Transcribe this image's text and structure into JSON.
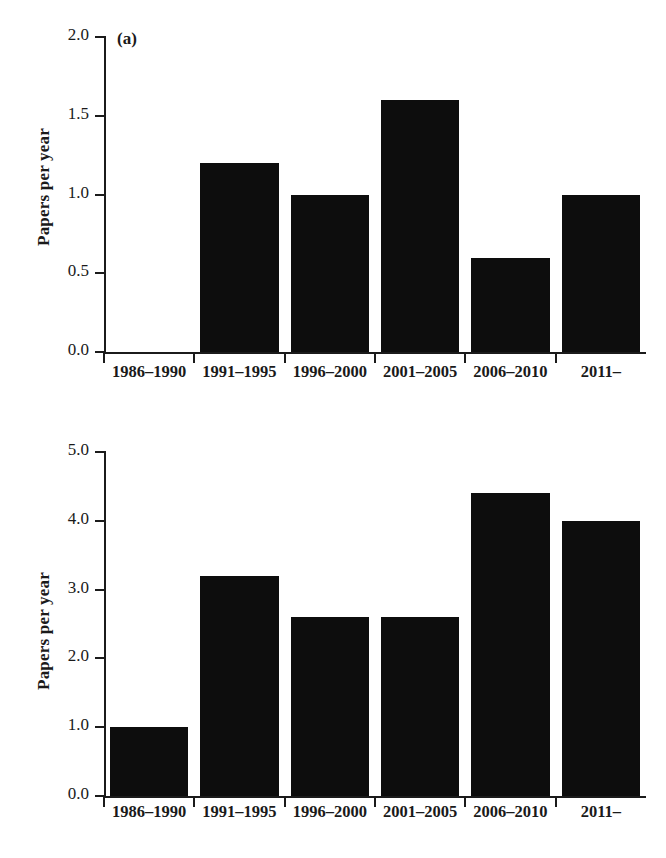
{
  "figure": {
    "background": "#ffffff",
    "bar_color": "#0d0d0d",
    "axis_color": "#1b1b1b"
  },
  "panels": [
    {
      "tag": "(a)",
      "ylabel": "Papers per year",
      "yticks": [
        "0.0",
        "0.5",
        "1.0",
        "1.5",
        "2.0"
      ],
      "xlabels": [
        "1986–1990",
        "1991–1995",
        "1996–2000",
        "2001–2005",
        "2006–2010",
        "2011–"
      ]
    },
    {
      "tag": "(b)",
      "ylabel": "Papers per year",
      "yticks": [
        "0.0",
        "1.0",
        "2.0",
        "3.0",
        "4.0",
        "5.0"
      ],
      "xlabels": [
        "1986–1990",
        "1991–1995",
        "1996–2000",
        "2001–2005",
        "2006–2010",
        "2011–"
      ]
    }
  ],
  "chart_data": [
    {
      "type": "bar",
      "panel": "(a)",
      "title": "",
      "xlabel": "",
      "ylabel": "Papers per year",
      "categories": [
        "1986–1990",
        "1991–1995",
        "1996–2000",
        "2001–2005",
        "2006–2010",
        "2011–"
      ],
      "values": [
        0.0,
        1.2,
        1.0,
        1.6,
        0.6,
        1.0
      ],
      "ylim": [
        0.0,
        2.0
      ],
      "ytick_values": [
        0.0,
        0.5,
        1.0,
        1.5,
        2.0
      ],
      "grid": false,
      "legend": "none",
      "bar_color": "#0d0d0d"
    },
    {
      "type": "bar",
      "panel": "(b)",
      "title": "",
      "xlabel": "",
      "ylabel": "Papers per year",
      "categories": [
        "1986–1990",
        "1991–1995",
        "1996–2000",
        "2001–2005",
        "2006–2010",
        "2011–"
      ],
      "values": [
        1.0,
        3.2,
        2.6,
        2.6,
        4.4,
        4.0
      ],
      "ylim": [
        0.0,
        5.0
      ],
      "ytick_values": [
        0.0,
        1.0,
        2.0,
        3.0,
        4.0,
        5.0
      ],
      "grid": false,
      "legend": "none",
      "bar_color": "#0d0d0d"
    }
  ]
}
